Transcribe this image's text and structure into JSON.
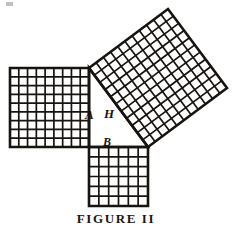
{
  "figure": {
    "caption": "FIGURE II",
    "ink_color": "#17130f",
    "background_color": "#ffffff",
    "labels": {
      "leg_a": "A",
      "hypotenuse": "H",
      "leg_b": "B"
    },
    "triangle": {
      "right_angle_vertex": [
        89,
        147
      ],
      "top_vertex": [
        89,
        68
      ],
      "right_vertex": [
        148,
        147
      ]
    },
    "squares": [
      {
        "name": "square-on-leg-a",
        "label": "A",
        "grid_rows": 9,
        "grid_cols": 9,
        "side_px": 79,
        "rotation_deg": 0,
        "corners": [
          [
            89,
            68
          ],
          [
            10,
            68
          ],
          [
            10,
            147
          ],
          [
            89,
            147
          ]
        ]
      },
      {
        "name": "square-on-leg-b",
        "label": "B",
        "grid_rows": 6,
        "grid_cols": 6,
        "side_px": 59,
        "rotation_deg": 0,
        "corners": [
          [
            89,
            147
          ],
          [
            148,
            147
          ],
          [
            148,
            206
          ],
          [
            89,
            206
          ]
        ]
      },
      {
        "name": "square-on-hypotenuse",
        "label": "H",
        "grid_rows": 11,
        "grid_cols": 11,
        "side_px": 99,
        "rotation_deg": -53.3,
        "corners": [
          [
            89,
            68
          ],
          [
            148,
            147
          ],
          [
            227,
            88
          ],
          [
            168,
            9
          ]
        ]
      }
    ]
  },
  "chart_data": {
    "type": "diagram",
    "title": "FIGURE II",
    "annotations": [
      "A",
      "H",
      "B"
    ],
    "series": [
      {
        "name": "A",
        "unit_squares": 81,
        "side_units": 9
      },
      {
        "name": "B",
        "unit_squares": 36,
        "side_units": 6
      },
      {
        "name": "H",
        "unit_squares": 121,
        "side_units": 11
      }
    ],
    "relation": "A^2 + B^2 = H^2"
  }
}
